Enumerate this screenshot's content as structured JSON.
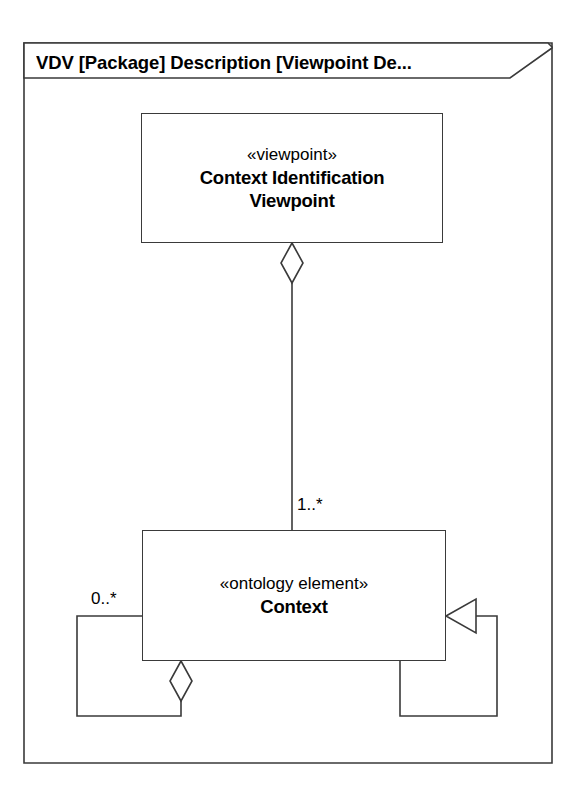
{
  "frame": {
    "title": "VDV [Package] Description [Viewpoint De...",
    "kind": "package-diagram-frame"
  },
  "classes": [
    {
      "id": "context-identification-viewpoint",
      "stereotype": "«viewpoint»",
      "name_line1": "Context Identification",
      "name_line2": "Viewpoint"
    },
    {
      "id": "context",
      "stereotype": "«ontology element»",
      "name_line1": "Context",
      "name_line2": ""
    }
  ],
  "multiplicities": {
    "viewpoint_to_context": "1..*",
    "context_self_left": "0..*"
  },
  "relationships": [
    {
      "id": "aggregation-viewpoint-context",
      "type": "aggregation",
      "from": "context-identification-viewpoint",
      "to": "context",
      "end_marker": "hollow-diamond",
      "multiplicity": "1..*"
    },
    {
      "id": "aggregation-context-self",
      "type": "aggregation",
      "from": "context",
      "to": "context",
      "end_marker": "hollow-diamond",
      "multiplicity": "0..*"
    },
    {
      "id": "generalization-context-self",
      "type": "generalization",
      "from": "context",
      "to": "context",
      "end_marker": "hollow-triangle",
      "multiplicity": ""
    }
  ],
  "colors": {
    "line": "#3a3a3a",
    "fill": "#ffffff",
    "text": "#000000"
  }
}
